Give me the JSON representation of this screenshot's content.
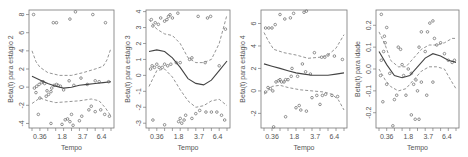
{
  "chart_data": [
    {
      "type": "scatter",
      "title": "",
      "xlabel": "Tempo",
      "ylabel": "Beta(t) para estágio 2",
      "xticks": [
        "0.36",
        "1.8",
        "3.7",
        "6.4"
      ],
      "yticks": [
        -4,
        -2,
        0,
        2,
        4,
        6,
        8
      ],
      "ylim": [
        -4.5,
        8.5
      ],
      "grid": false,
      "box": {
        "x0": 29,
        "x1": 114,
        "y0": 10,
        "y1": 128
      },
      "points": [
        [
          0.02,
          8.0
        ],
        [
          0.27,
          7.1
        ],
        [
          0.31,
          7.1
        ],
        [
          0.48,
          7.5
        ],
        [
          0.55,
          8.3
        ],
        [
          0.77,
          8.0
        ],
        [
          0.93,
          7.1
        ],
        [
          0.03,
          -0.1
        ],
        [
          0.06,
          0.1
        ],
        [
          0.09,
          0.3
        ],
        [
          0.12,
          0.5
        ],
        [
          0.14,
          0.6
        ],
        [
          0.16,
          0.4
        ],
        [
          0.19,
          -0.4
        ],
        [
          0.21,
          -0.8
        ],
        [
          0.25,
          -0.1
        ],
        [
          0.28,
          0.2
        ],
        [
          0.31,
          0.3
        ],
        [
          0.33,
          0.2
        ],
        [
          0.36,
          0.1
        ],
        [
          0.4,
          -0.3
        ],
        [
          0.47,
          0.7
        ],
        [
          0.53,
          0.2
        ],
        [
          0.62,
          1.0
        ],
        [
          0.7,
          0.3
        ],
        [
          0.8,
          0.7
        ],
        [
          0.85,
          0.6
        ],
        [
          0.97,
          0.6
        ],
        [
          0.05,
          -0.6
        ],
        [
          0.1,
          -1.2
        ],
        [
          0.18,
          -1.0
        ],
        [
          0.24,
          -0.5
        ],
        [
          0.08,
          -3.0
        ],
        [
          0.24,
          -4.0
        ],
        [
          0.38,
          -4.1
        ],
        [
          0.42,
          -3.6
        ],
        [
          0.45,
          -3.5
        ],
        [
          0.48,
          -3.8
        ],
        [
          0.5,
          -3.0
        ],
        [
          0.52,
          -4.2
        ],
        [
          0.6,
          -3.7
        ],
        [
          0.63,
          -3.2
        ],
        [
          0.72,
          -2.5
        ],
        [
          0.75,
          -2.1
        ],
        [
          0.8,
          -2.7
        ],
        [
          0.87,
          -2.5
        ],
        [
          0.92,
          -3.0
        ],
        [
          0.98,
          -3.2
        ]
      ],
      "fit": [
        [
          0,
          1.2
        ],
        [
          0.1,
          0.8
        ],
        [
          0.2,
          0.4
        ],
        [
          0.3,
          0.1
        ],
        [
          0.4,
          -0.1
        ],
        [
          0.5,
          0.0
        ],
        [
          0.6,
          0.2
        ],
        [
          0.7,
          0.3
        ],
        [
          0.8,
          0.4
        ],
        [
          0.9,
          0.5
        ],
        [
          1,
          0.6
        ]
      ],
      "upper": [
        [
          0,
          4.0
        ],
        [
          0.05,
          2.8
        ],
        [
          0.1,
          2.2
        ],
        [
          0.2,
          1.6
        ],
        [
          0.35,
          1.3
        ],
        [
          0.5,
          1.3
        ],
        [
          0.65,
          1.6
        ],
        [
          0.8,
          2.0
        ],
        [
          0.9,
          2.3
        ],
        [
          0.95,
          3.0
        ],
        [
          1,
          4.3
        ]
      ],
      "lower": [
        [
          0,
          -1.8
        ],
        [
          0.1,
          -1.2
        ],
        [
          0.2,
          -1.5
        ],
        [
          0.3,
          -1.7
        ],
        [
          0.45,
          -1.6
        ],
        [
          0.6,
          -1.5
        ],
        [
          0.75,
          -1.3
        ],
        [
          0.85,
          -1.5
        ],
        [
          0.93,
          -2.3
        ],
        [
          1,
          -3.2
        ]
      ]
    },
    {
      "type": "scatter",
      "title": "",
      "xlabel": "Tempo",
      "ylabel": "Beta(t) para estágio 3",
      "xticks": [
        "0.36",
        "1.8",
        "3.7",
        "6.4"
      ],
      "yticks": [
        -3,
        -2,
        -1,
        0,
        1,
        2,
        3,
        4
      ],
      "ylim": [
        -3.3,
        4.1
      ],
      "grid": false,
      "box": {
        "x0": 146,
        "x1": 230,
        "y0": 10,
        "y1": 128
      },
      "points": [
        [
          0.03,
          3.5
        ],
        [
          0.05,
          3.1
        ],
        [
          0.08,
          3.3
        ],
        [
          0.12,
          3.2
        ],
        [
          0.15,
          3.6
        ],
        [
          0.2,
          3.4
        ],
        [
          0.23,
          3.5
        ],
        [
          0.25,
          3.7
        ],
        [
          0.27,
          3.8
        ],
        [
          0.3,
          3.6
        ],
        [
          0.37,
          3.9
        ],
        [
          0.63,
          3.7
        ],
        [
          0.75,
          3.6
        ],
        [
          0.79,
          3.7
        ],
        [
          0.98,
          2.9
        ],
        [
          0.02,
          0.4
        ],
        [
          0.04,
          0.6
        ],
        [
          0.07,
          0.5
        ],
        [
          0.1,
          0.7
        ],
        [
          0.13,
          0.5
        ],
        [
          0.17,
          0.5
        ],
        [
          0.2,
          0.7
        ],
        [
          0.24,
          0.6
        ],
        [
          0.28,
          0.7
        ],
        [
          0.35,
          0.8
        ],
        [
          0.4,
          0.8
        ],
        [
          0.52,
          1.0
        ],
        [
          0.55,
          1.1
        ],
        [
          0.72,
          0.8
        ],
        [
          0.9,
          0.6
        ],
        [
          0.05,
          -2.8
        ],
        [
          0.2,
          -3.1
        ],
        [
          0.38,
          -2.9
        ],
        [
          0.4,
          -2.7
        ],
        [
          0.42,
          -3.0
        ],
        [
          0.45,
          -2.8
        ],
        [
          0.47,
          -2.5
        ],
        [
          0.55,
          -2.7
        ],
        [
          0.6,
          -2.4
        ],
        [
          0.65,
          -2.2
        ],
        [
          0.73,
          -2.3
        ],
        [
          0.8,
          -2.3
        ],
        [
          0.87,
          -2.3
        ],
        [
          0.93,
          -2.5
        ],
        [
          0.97,
          -2.8
        ]
      ],
      "fit": [
        [
          0,
          1.5
        ],
        [
          0.1,
          1.6
        ],
        [
          0.2,
          1.5
        ],
        [
          0.3,
          1.1
        ],
        [
          0.4,
          0.5
        ],
        [
          0.5,
          -0.2
        ],
        [
          0.6,
          -0.5
        ],
        [
          0.7,
          -0.6
        ],
        [
          0.8,
          -0.3
        ],
        [
          0.9,
          0.3
        ],
        [
          1,
          0.9
        ]
      ],
      "upper": [
        [
          0,
          3.5
        ],
        [
          0.1,
          2.9
        ],
        [
          0.2,
          2.6
        ],
        [
          0.3,
          2.5
        ],
        [
          0.4,
          2.0
        ],
        [
          0.5,
          1.1
        ],
        [
          0.6,
          0.8
        ],
        [
          0.7,
          0.8
        ],
        [
          0.8,
          1.0
        ],
        [
          0.9,
          2.0
        ],
        [
          1,
          3.8
        ]
      ],
      "lower": [
        [
          0,
          -0.7
        ],
        [
          0.1,
          0.3
        ],
        [
          0.2,
          0.4
        ],
        [
          0.3,
          -0.1
        ],
        [
          0.4,
          -0.9
        ],
        [
          0.5,
          -1.6
        ],
        [
          0.6,
          -2.0
        ],
        [
          0.7,
          -1.9
        ],
        [
          0.8,
          -1.6
        ],
        [
          0.9,
          -1.5
        ],
        [
          1,
          -1.9
        ]
      ]
    },
    {
      "type": "scatter",
      "title": "",
      "xlabel": "Tempo",
      "ylabel": "Beta(t) para estágio 4",
      "xticks": [
        "0.36",
        "1.8",
        "3.7",
        "6.4"
      ],
      "yticks": [
        -2,
        0,
        2,
        4,
        6
      ],
      "ylim": [
        -3.3,
        7.2
      ],
      "grid": false,
      "box": {
        "x0": 261,
        "x1": 347,
        "y0": 10,
        "y1": 128
      },
      "points": [
        [
          0.02,
          5.6
        ],
        [
          0.06,
          5.6
        ],
        [
          0.1,
          5.6
        ],
        [
          0.14,
          5.9
        ],
        [
          0.2,
          6.8
        ],
        [
          0.26,
          6.4
        ],
        [
          0.33,
          6.5
        ],
        [
          0.37,
          6.9
        ],
        [
          0.5,
          7.0
        ],
        [
          0.53,
          7.1
        ],
        [
          0.63,
          3.4
        ],
        [
          0.72,
          3.0
        ],
        [
          0.76,
          3.0
        ],
        [
          0.8,
          3.2
        ],
        [
          0.88,
          3.1
        ],
        [
          0.98,
          2.8
        ],
        [
          0.48,
          2.4
        ],
        [
          0.35,
          2.0
        ],
        [
          0.58,
          1.5
        ],
        [
          0.02,
          -0.1
        ],
        [
          0.05,
          0.3
        ],
        [
          0.08,
          0.2
        ],
        [
          0.11,
          0.0
        ],
        [
          0.15,
          0.8
        ],
        [
          0.18,
          0.9
        ],
        [
          0.2,
          1.0
        ],
        [
          0.22,
          0.8
        ],
        [
          0.25,
          0.8
        ],
        [
          0.27,
          1.0
        ],
        [
          0.3,
          1.0
        ],
        [
          0.34,
          1.3
        ],
        [
          0.42,
          1.3
        ],
        [
          0.52,
          1.7
        ],
        [
          0.6,
          -0.6
        ],
        [
          0.66,
          -0.4
        ],
        [
          0.73,
          -0.4
        ],
        [
          0.77,
          -0.3
        ],
        [
          0.85,
          -0.4
        ],
        [
          0.92,
          -0.5
        ],
        [
          0.12,
          -3.2
        ],
        [
          0.27,
          -2.3
        ],
        [
          0.4,
          -1.5
        ],
        [
          0.44,
          -1.3
        ],
        [
          0.46,
          -1.7
        ],
        [
          0.53,
          -1.8
        ],
        [
          0.7,
          -1.2
        ]
      ],
      "fit": [
        [
          0,
          2.4
        ],
        [
          0.1,
          2.2
        ],
        [
          0.2,
          2.0
        ],
        [
          0.3,
          1.8
        ],
        [
          0.4,
          1.6
        ],
        [
          0.5,
          1.5
        ],
        [
          0.6,
          1.4
        ],
        [
          0.7,
          1.4
        ],
        [
          0.8,
          1.4
        ],
        [
          0.9,
          1.5
        ],
        [
          1,
          1.6
        ]
      ],
      "upper": [
        [
          0,
          5.2
        ],
        [
          0.05,
          4.5
        ],
        [
          0.12,
          3.7
        ],
        [
          0.25,
          3.4
        ],
        [
          0.4,
          3.2
        ],
        [
          0.55,
          2.9
        ],
        [
          0.7,
          3.0
        ],
        [
          0.8,
          3.2
        ],
        [
          0.9,
          3.8
        ],
        [
          1,
          5.0
        ]
      ],
      "lower": [
        [
          0,
          -0.3
        ],
        [
          0.1,
          0.4
        ],
        [
          0.2,
          0.5
        ],
        [
          0.3,
          0.3
        ],
        [
          0.45,
          0.1
        ],
        [
          0.6,
          0.0
        ],
        [
          0.75,
          -0.1
        ],
        [
          0.85,
          -0.3
        ],
        [
          0.93,
          -0.8
        ],
        [
          1,
          -1.7
        ]
      ]
    },
    {
      "type": "scatter",
      "title": "",
      "xlabel": "Tempo",
      "ylabel": "Beta(t) para idade",
      "xticks": [
        "0.36",
        "1.8",
        "3.7",
        "6.4"
      ],
      "yticks": [
        -0.2,
        -0.1,
        0.0,
        0.1,
        0.2
      ],
      "ylim": [
        -0.27,
        0.27
      ],
      "grid": false,
      "box": {
        "x0": 376,
        "x1": 459,
        "y0": 10,
        "y1": 128
      },
      "points": [
        [
          0.03,
          0.25
        ],
        [
          0.1,
          0.19
        ],
        [
          0.07,
          0.15
        ],
        [
          0.08,
          0.12
        ],
        [
          0.06,
          0.08
        ],
        [
          0.03,
          0.04
        ],
        [
          0.02,
          -0.03
        ],
        [
          0.05,
          -0.15
        ],
        [
          0.1,
          -0.07
        ],
        [
          0.14,
          -0.02
        ],
        [
          0.25,
          0.1
        ],
        [
          0.28,
          0.09
        ],
        [
          0.3,
          0.02
        ],
        [
          0.32,
          -0.03
        ],
        [
          0.35,
          -0.12
        ],
        [
          0.38,
          0.0
        ],
        [
          0.42,
          -0.02
        ],
        [
          0.45,
          -0.07
        ],
        [
          0.48,
          -0.05
        ],
        [
          0.5,
          -0.1
        ],
        [
          0.52,
          0.1
        ],
        [
          0.55,
          0.17
        ],
        [
          0.6,
          0.08
        ],
        [
          0.63,
          0.17
        ],
        [
          0.66,
          0.21
        ],
        [
          0.7,
          0.22
        ],
        [
          0.72,
          0.14
        ],
        [
          0.75,
          0.11
        ],
        [
          0.8,
          0.12
        ],
        [
          0.85,
          0.07
        ],
        [
          0.9,
          0.04
        ],
        [
          0.95,
          0.03
        ],
        [
          0.98,
          0.04
        ],
        [
          0.2,
          -0.14
        ],
        [
          0.23,
          -0.12
        ],
        [
          0.55,
          -0.06
        ],
        [
          0.62,
          -0.12
        ],
        [
          0.7,
          -0.06
        ],
        [
          0.18,
          -0.26
        ],
        [
          0.42,
          -0.21
        ],
        [
          0.47,
          -0.23
        ],
        [
          0.52,
          -0.23
        ]
      ],
      "fit": [
        [
          0,
          0.08
        ],
        [
          0.1,
          0.02
        ],
        [
          0.2,
          -0.03
        ],
        [
          0.3,
          -0.04
        ],
        [
          0.4,
          -0.03
        ],
        [
          0.5,
          0.01
        ],
        [
          0.6,
          0.05
        ],
        [
          0.7,
          0.07
        ],
        [
          0.8,
          0.06
        ],
        [
          0.9,
          0.04
        ],
        [
          1,
          0.03
        ]
      ],
      "upper": [
        [
          0,
          0.17
        ],
        [
          0.08,
          0.11
        ],
        [
          0.15,
          0.04
        ],
        [
          0.25,
          0.01
        ],
        [
          0.35,
          0.01
        ],
        [
          0.45,
          0.05
        ],
        [
          0.55,
          0.09
        ],
        [
          0.65,
          0.11
        ],
        [
          0.75,
          0.11
        ],
        [
          0.85,
          0.12
        ],
        [
          0.95,
          0.14
        ],
        [
          1,
          0.14
        ]
      ],
      "lower": [
        [
          0,
          0.0
        ],
        [
          0.08,
          -0.05
        ],
        [
          0.15,
          -0.08
        ],
        [
          0.25,
          -0.1
        ],
        [
          0.35,
          -0.09
        ],
        [
          0.45,
          -0.05
        ],
        [
          0.55,
          -0.01
        ],
        [
          0.65,
          0.01
        ],
        [
          0.75,
          0.01
        ],
        [
          0.85,
          0.0
        ],
        [
          0.93,
          -0.05
        ],
        [
          1,
          -0.09
        ]
      ]
    }
  ]
}
